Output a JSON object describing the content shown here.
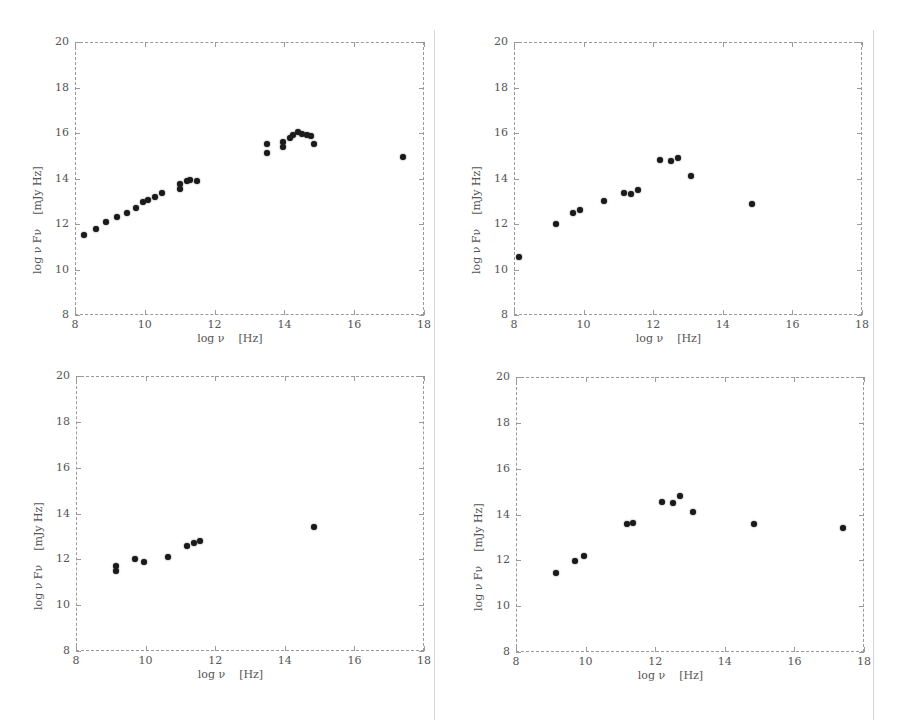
{
  "chart_data": [
    {
      "type": "scatter",
      "panel": "top-left",
      "title": "",
      "xlabel": "log ν    [Hz]",
      "ylabel": "log ν F_ν    [mJy Hz]",
      "xlim": [
        8,
        18
      ],
      "ylim": [
        8,
        20
      ],
      "xticks": [
        "8",
        "10",
        "12",
        "14",
        "16",
        "18"
      ],
      "yticks": [
        "8",
        "10",
        "12",
        "14",
        "16",
        "18",
        "20"
      ],
      "grid": false,
      "points": [
        [
          8.25,
          11.5
        ],
        [
          8.6,
          11.8
        ],
        [
          8.9,
          12.1
        ],
        [
          9.2,
          12.3
        ],
        [
          9.5,
          12.5
        ],
        [
          9.75,
          12.7
        ],
        [
          9.95,
          12.95
        ],
        [
          10.1,
          13.05
        ],
        [
          10.3,
          13.2
        ],
        [
          10.5,
          13.35
        ],
        [
          11.0,
          13.55
        ],
        [
          11.0,
          13.75
        ],
        [
          11.2,
          13.9
        ],
        [
          11.3,
          13.95
        ],
        [
          11.5,
          13.9
        ],
        [
          13.5,
          15.1
        ],
        [
          13.5,
          15.5
        ],
        [
          13.95,
          15.4
        ],
        [
          13.95,
          15.6
        ],
        [
          14.15,
          15.8
        ],
        [
          14.25,
          15.9
        ],
        [
          14.4,
          16.05
        ],
        [
          14.5,
          15.95
        ],
        [
          14.65,
          15.9
        ],
        [
          14.75,
          15.85
        ],
        [
          14.85,
          15.5
        ],
        [
          17.4,
          14.95
        ]
      ]
    },
    {
      "type": "scatter",
      "panel": "top-right",
      "title": "",
      "xlabel": "log ν    [Hz]",
      "ylabel": "log ν F_ν    [mJy Hz]",
      "xlim": [
        8,
        18
      ],
      "ylim": [
        8,
        20
      ],
      "xticks": [
        "8",
        "10",
        "12",
        "14",
        "16",
        "18"
      ],
      "yticks": [
        "8",
        "10",
        "12",
        "14",
        "16",
        "18",
        "20"
      ],
      "grid": false,
      "points": [
        [
          8.15,
          10.55
        ],
        [
          9.2,
          12.0
        ],
        [
          9.7,
          12.5
        ],
        [
          9.9,
          12.6
        ],
        [
          10.6,
          13.0
        ],
        [
          11.15,
          13.35
        ],
        [
          11.35,
          13.3
        ],
        [
          11.55,
          13.5
        ],
        [
          12.2,
          14.8
        ],
        [
          12.5,
          14.75
        ],
        [
          12.7,
          14.9
        ],
        [
          13.1,
          14.1
        ],
        [
          14.85,
          12.9
        ]
      ]
    },
    {
      "type": "scatter",
      "panel": "bottom-left",
      "title": "",
      "xlabel": "log ν    [Hz]",
      "ylabel": "log ν F_ν    [mJy Hz]",
      "xlim": [
        8,
        18
      ],
      "ylim": [
        8,
        20
      ],
      "xticks": [
        "8",
        "10",
        "12",
        "14",
        "16",
        "18"
      ],
      "yticks": [
        "8",
        "10",
        "12",
        "14",
        "16",
        "18",
        "20"
      ],
      "grid": false,
      "points": [
        [
          9.15,
          11.5
        ],
        [
          9.15,
          11.7
        ],
        [
          9.7,
          12.0
        ],
        [
          9.95,
          11.9
        ],
        [
          10.65,
          12.1
        ],
        [
          11.2,
          12.6
        ],
        [
          11.4,
          12.7
        ],
        [
          11.55,
          12.8
        ],
        [
          14.85,
          13.4
        ]
      ]
    },
    {
      "type": "scatter",
      "panel": "bottom-right",
      "title": "",
      "xlabel": "log ν    [Hz]",
      "ylabel": "log ν F_ν    [mJy Hz]",
      "xlim": [
        8,
        18
      ],
      "ylim": [
        8,
        20
      ],
      "xticks": [
        "8",
        "10",
        "12",
        "14",
        "16",
        "18"
      ],
      "yticks": [
        "8",
        "10",
        "12",
        "14",
        "16",
        "18",
        "20"
      ],
      "grid": false,
      "points": [
        [
          9.15,
          11.45
        ],
        [
          9.7,
          11.95
        ],
        [
          9.95,
          12.2
        ],
        [
          11.2,
          13.6
        ],
        [
          11.35,
          13.65
        ],
        [
          12.2,
          14.55
        ],
        [
          12.5,
          14.5
        ],
        [
          12.7,
          14.8
        ],
        [
          13.1,
          14.1
        ],
        [
          14.85,
          13.6
        ],
        [
          17.4,
          13.4
        ]
      ]
    }
  ],
  "layout": {
    "panels": [
      {
        "name": "top-left",
        "frame": [
          75,
          42,
          424,
          315
        ]
      },
      {
        "name": "top-right",
        "frame": [
          514,
          42,
          862,
          315
        ]
      },
      {
        "name": "bottom-left",
        "frame": [
          76,
          376,
          424,
          651
        ]
      },
      {
        "name": "bottom-right",
        "frame": [
          516,
          377,
          864,
          652
        ]
      }
    ]
  },
  "colors": {
    "marker": "#1a1a1a",
    "axis": "#9a9a9a",
    "text": "#555555"
  }
}
